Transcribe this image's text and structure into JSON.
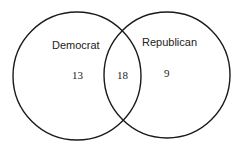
{
  "diagram": {
    "type": "venn",
    "sets": [
      {
        "name": "Democrat",
        "only_count": "13"
      },
      {
        "name": "Republican",
        "only_count": "9"
      }
    ],
    "intersection_count": "18",
    "colors": {
      "stroke": "#1a1a1a",
      "text": "#222222",
      "background": "#ffffff"
    }
  }
}
